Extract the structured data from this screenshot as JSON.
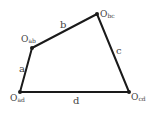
{
  "diagram": {
    "type": "four-bar-linkage",
    "vertices": [
      {
        "id": "ab",
        "label_main": "O",
        "label_sub": "ab",
        "x": 32,
        "y": 48
      },
      {
        "id": "bc",
        "label_main": "O",
        "label_sub": "bc",
        "x": 97,
        "y": 14
      },
      {
        "id": "cd",
        "label_main": "O",
        "label_sub": "cd",
        "x": 129,
        "y": 92
      },
      {
        "id": "ad",
        "label_main": "O",
        "label_sub": "ad",
        "x": 20,
        "y": 92
      }
    ],
    "sides": [
      {
        "id": "a",
        "label": "a",
        "from": "ad",
        "to": "ab"
      },
      {
        "id": "b",
        "label": "b",
        "from": "ab",
        "to": "bc"
      },
      {
        "id": "c",
        "label": "c",
        "from": "bc",
        "to": "cd"
      },
      {
        "id": "d",
        "label": "d",
        "from": "ad",
        "to": "cd"
      }
    ],
    "colors": {
      "line": "#1a1a1a",
      "text": "#444444",
      "background": "#ffffff"
    }
  }
}
